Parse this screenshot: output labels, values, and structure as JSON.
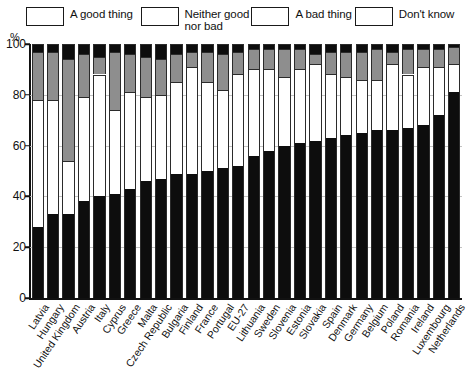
{
  "axis": {
    "unit_label": "%",
    "y_ticks": [
      0,
      20,
      40,
      60,
      80,
      100
    ],
    "y_min": 0,
    "y_max": 100
  },
  "legend": {
    "items": [
      {
        "label": "A good thing",
        "color": "#0d0d0d",
        "key": "good"
      },
      {
        "label": "Neither good\nnor bad",
        "color": "#ffffff",
        "key": "neither"
      },
      {
        "label": "A bad thing",
        "color": "#8e8e8e",
        "key": "bad"
      },
      {
        "label": "Don't know",
        "color": "#0d0d0d",
        "key": "dontknow"
      }
    ]
  },
  "chart_data": {
    "type": "bar",
    "title": "",
    "subtitle": "",
    "xlabel": "",
    "ylabel": "%",
    "ylim": [
      0,
      100
    ],
    "grid": true,
    "stacked": true,
    "stacked_total": 100,
    "legend_position": "top",
    "legend_entries": [
      "A good thing",
      "Neither good nor bad",
      "A bad thing",
      "Don't know"
    ],
    "tick_labels_y": [
      "0",
      "20",
      "40",
      "60",
      "80",
      "100"
    ],
    "categories": [
      "Latvia",
      "Hungary",
      "United Kingdom",
      "Austria",
      "Italy",
      "Cyprus",
      "Greece",
      "Malta",
      "Czech Republic",
      "Bulgaria",
      "Finland",
      "France",
      "Portugal",
      "EU-27",
      "Lithuania",
      "Sweden",
      "Slovenia",
      "Estonia",
      "Slovakia",
      "Spain",
      "Denmark",
      "Germany",
      "Belgium",
      "Poland",
      "Romania",
      "Ireland",
      "Luxembourg",
      "Netherlands"
    ],
    "series": [
      {
        "name": "A good thing",
        "color": "#0d0d0d",
        "values": [
          28,
          33,
          33,
          38,
          40,
          41,
          43,
          46,
          47,
          49,
          49,
          50,
          51,
          52,
          56,
          58,
          60,
          61,
          62,
          63,
          64,
          65,
          66,
          66,
          67,
          68,
          72,
          81
        ]
      },
      {
        "name": "Neither good nor bad",
        "color": "#ffffff",
        "values": [
          50,
          45,
          21,
          41,
          48,
          33,
          38,
          33,
          33,
          36,
          42,
          35,
          31,
          36,
          34,
          32,
          27,
          29,
          30,
          25,
          23,
          21,
          20,
          26,
          21,
          23,
          19,
          11
        ]
      },
      {
        "name": "A bad thing",
        "color": "#8e8e8e",
        "values": [
          19,
          19,
          40,
          17,
          7,
          23,
          15,
          16,
          14,
          11,
          6,
          12,
          14,
          9,
          8,
          8,
          11,
          8,
          4,
          9,
          10,
          11,
          12,
          5,
          10,
          7,
          7,
          7
        ]
      },
      {
        "name": "Don't know",
        "color": "#0d0d0d",
        "values": [
          3,
          3,
          6,
          4,
          5,
          3,
          4,
          5,
          6,
          4,
          3,
          3,
          4,
          3,
          2,
          2,
          2,
          2,
          4,
          3,
          3,
          3,
          2,
          3,
          2,
          2,
          2,
          1
        ]
      }
    ]
  }
}
